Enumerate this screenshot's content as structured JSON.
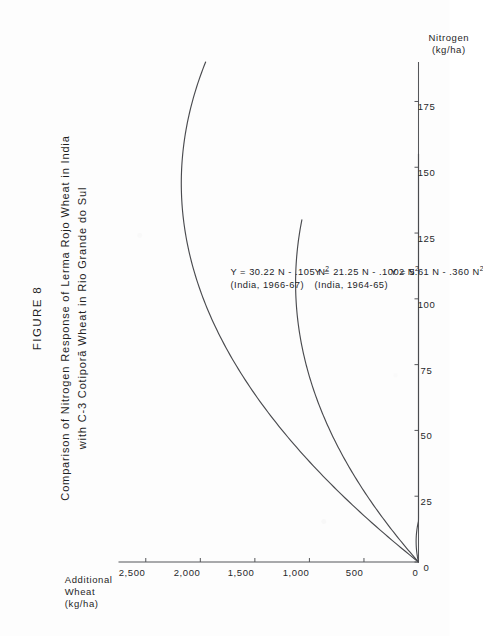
{
  "figure": {
    "label": "FIGURE 8",
    "caption_line1": "Comparison of Nitrogen Response of Lerma Rojo Wheat in India",
    "caption_line2": "with C-3 Cotiporã Wheat in Rio Grande do Sul"
  },
  "axes": {
    "x_title_line1": "Nitrogen",
    "x_title_line2": "(kg/ha)",
    "y_title_line1": "Additional",
    "y_title_line2": "Wheat",
    "y_title_line3": "(kg/ha)"
  },
  "annotations": [
    {
      "eq_prefix": "Y = 30.22 N - .105 N",
      "eq_sup": "2",
      "source": "(India, 1966-67)"
    },
    {
      "eq_prefix": "Y = 21.25 N - .1002 N",
      "eq_sup": "2",
      "source": "(India, 1964-65)"
    },
    {
      "eq_prefix": "Y = 5.61 N - .360 N",
      "eq_sup": "2",
      "source": ""
    }
  ],
  "colors": {
    "ink": "#2a2a2a",
    "axis": "#55565a",
    "curve": "#4a4b4f",
    "paper": "#fdfdfd"
  },
  "chart_data": {
    "type": "line",
    "title": "Comparison of Nitrogen Response of Lerma Rojo Wheat in India with C-3 Cotiporã Wheat in Rio Grande do Sul",
    "xlabel": "Nitrogen (kg/ha)",
    "ylabel": "Additional Wheat (kg/ha)",
    "xlim": [
      0,
      190
    ],
    "ylim": [
      0,
      2750
    ],
    "xticks": [
      0,
      25,
      50,
      75,
      100,
      125,
      150,
      175
    ],
    "xticklabels": [
      "0",
      "25",
      "50",
      "75",
      "100",
      "125",
      "150",
      "175"
    ],
    "yticks": [
      0,
      500,
      1000,
      1500,
      2000,
      2500
    ],
    "yticklabels": [
      "0",
      "500",
      "1,000",
      "1,500",
      "2,000",
      "2,500"
    ],
    "grid": false,
    "legend": "none",
    "series": [
      {
        "name": "Lerma Rojo, India 1966-67",
        "equation": "Y = 30.22 N - .105 N^2",
        "coef_linear": 30.22,
        "coef_quadratic": -0.105,
        "x_range": [
          0,
          190
        ],
        "x": [
          0,
          20,
          40,
          60,
          80,
          100,
          120,
          140,
          160,
          180,
          190
        ],
        "y": [
          0,
          562,
          1041,
          1435,
          1746,
          1972,
          2115,
          2173,
          2147,
          2038,
          1951
        ]
      },
      {
        "name": "Lerma Rojo, India 1964-65",
        "equation": "Y = 21.25 N - .1002 N^2",
        "coef_linear": 21.25,
        "coef_quadratic": -0.1002,
        "x_range": [
          0,
          130
        ],
        "x": [
          0,
          20,
          40,
          60,
          80,
          100,
          110,
          120,
          130
        ],
        "y": [
          0,
          385,
          690,
          914,
          1059,
          1123,
          1125,
          1107,
          1069
        ]
      },
      {
        "name": "C-3 Cotiporã, Rio Grande do Sul",
        "equation": "Y = 5.61 N - .360 N^2",
        "coef_linear": 5.61,
        "coef_quadratic": -0.36,
        "x_range": [
          0,
          155
        ],
        "x": [
          0,
          20,
          40,
          60,
          80,
          100,
          120,
          140,
          155
        ],
        "y": [
          0,
          80,
          134,
          161,
          161,
          134,
          80,
          0,
          0
        ]
      }
    ]
  }
}
